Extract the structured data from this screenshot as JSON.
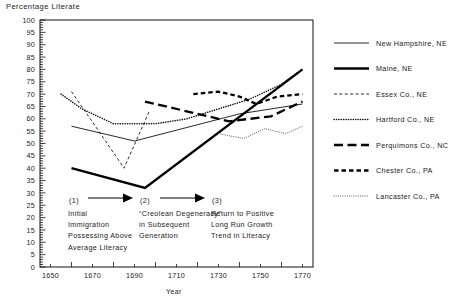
{
  "chart_data": {
    "type": "line",
    "title": "",
    "ylabel": "Percentage Literate",
    "xlabel": "Year",
    "xlim": [
      1645,
      1775
    ],
    "ylim": [
      0,
      100
    ],
    "grid": false,
    "legend_position": "right",
    "xticks": [
      "1650",
      "1670",
      "1690",
      "1710",
      "1730",
      "1750",
      "1770"
    ],
    "xtick_values": [
      1650,
      1670,
      1690,
      1710,
      1730,
      1750,
      1770
    ],
    "xminor_step": 10,
    "yticks": [
      "0",
      "5",
      "10",
      "15",
      "20",
      "25",
      "30",
      "35",
      "40",
      "45",
      "50",
      "55",
      "60",
      "65",
      "70",
      "75",
      "80",
      "85",
      "90",
      "95",
      "100"
    ],
    "ytick_values": [
      0,
      5,
      10,
      15,
      20,
      25,
      30,
      35,
      40,
      45,
      50,
      55,
      60,
      65,
      70,
      75,
      80,
      85,
      90,
      95,
      100
    ],
    "yminor_step": 1,
    "series": [
      {
        "name": "New Hampshire, NE",
        "style": "solid-thin",
        "color": "#111111",
        "x": [
          1660,
          1690,
          1740,
          1770
        ],
        "values": [
          57,
          51,
          62,
          66
        ]
      },
      {
        "name": "Maine, NE",
        "style": "solid-thick",
        "color": "#000000",
        "x": [
          1660,
          1695,
          1770
        ],
        "values": [
          40,
          32,
          80
        ]
      },
      {
        "name": "Essex Co., NE",
        "style": "dashed-fine",
        "color": "#111111",
        "x": [
          1660,
          1673,
          1685,
          1697
        ],
        "values": [
          71,
          55,
          40,
          63
        ]
      },
      {
        "name": "Hartford Co., NE",
        "style": "dotted-dense",
        "color": "#111111",
        "x": [
          1655,
          1665,
          1680,
          1700,
          1715,
          1730,
          1745,
          1760,
          1768
        ],
        "values": [
          70,
          64,
          58,
          58,
          60,
          64,
          68,
          74,
          79
        ]
      },
      {
        "name": "Perquimons Co., NC",
        "style": "dashed-long-thick",
        "color": "#000000",
        "x": [
          1695,
          1705,
          1720,
          1735,
          1755,
          1770
        ],
        "values": [
          67,
          65,
          62,
          59,
          61,
          67
        ]
      },
      {
        "name": "Chester Co., PA",
        "style": "dashed-short-thick",
        "color": "#000000",
        "x": [
          1718,
          1730,
          1740,
          1748,
          1758,
          1770
        ],
        "values": [
          70,
          71,
          69,
          66,
          69,
          70
        ]
      },
      {
        "name": "Lancaster Co., PA",
        "style": "dotted-fine",
        "color": "#444444",
        "x": [
          1730,
          1742,
          1752,
          1762,
          1770
        ],
        "values": [
          54,
          52,
          56,
          54,
          57
        ]
      }
    ],
    "annotations": [
      {
        "marker": "(1)",
        "lines": [
          "Initial",
          "Immigration",
          "Possessing Above",
          "Average Literacy"
        ]
      },
      {
        "marker": "(2)",
        "lines": [
          "“Creolean Degeneracy”",
          "in Subsequent",
          "Generation"
        ]
      },
      {
        "marker": "(3)",
        "lines": [
          "Return to Positive",
          "Long Run Growth",
          "Trend in Literacy"
        ]
      }
    ],
    "arrows": [
      {
        "name": "arrow-1-to-2"
      },
      {
        "name": "arrow-2-to-3"
      }
    ]
  },
  "legend": {
    "items": [
      {
        "label": "New Hampshire, NE",
        "style": "solid-thin"
      },
      {
        "label": "Maine, NE",
        "style": "solid-thick"
      },
      {
        "label": "Essex Co., NE",
        "style": "dashed-fine"
      },
      {
        "label": "Hartford Co., NE",
        "style": "dotted-dense"
      },
      {
        "label": "Perquimons Co., NC",
        "style": "dashed-long-thick"
      },
      {
        "label": "Chester Co., PA",
        "style": "dashed-short-thick"
      },
      {
        "label": "Lancaster Co., PA",
        "style": "dotted-fine"
      }
    ]
  }
}
